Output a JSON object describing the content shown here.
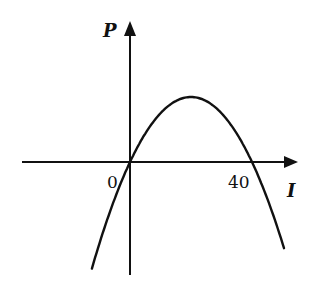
{
  "chart_data": {
    "type": "line",
    "title": "",
    "xlabel": "I",
    "ylabel": "P",
    "x_ticks": [
      "0",
      "40"
    ],
    "function": "P = k·I·(40 − I), downward-opening parabola",
    "roots": [
      0,
      40
    ],
    "vertex_x": 20,
    "grid": false,
    "legend": null,
    "series": [
      {
        "name": "P(I)",
        "x": [
          -12,
          -8,
          -4,
          0,
          5,
          10,
          15,
          20,
          25,
          30,
          35,
          40,
          45,
          50
        ],
        "y": [
          -104,
          -64,
          -29,
          0,
          36,
          60,
          71,
          76,
          71,
          60,
          36,
          0,
          -29,
          -64
        ]
      }
    ]
  },
  "labels": {
    "y_axis": "P",
    "x_axis": "I",
    "origin": "0",
    "root_tick": "40"
  },
  "colors": {
    "stroke": "#111111",
    "background": "#ffffff"
  }
}
